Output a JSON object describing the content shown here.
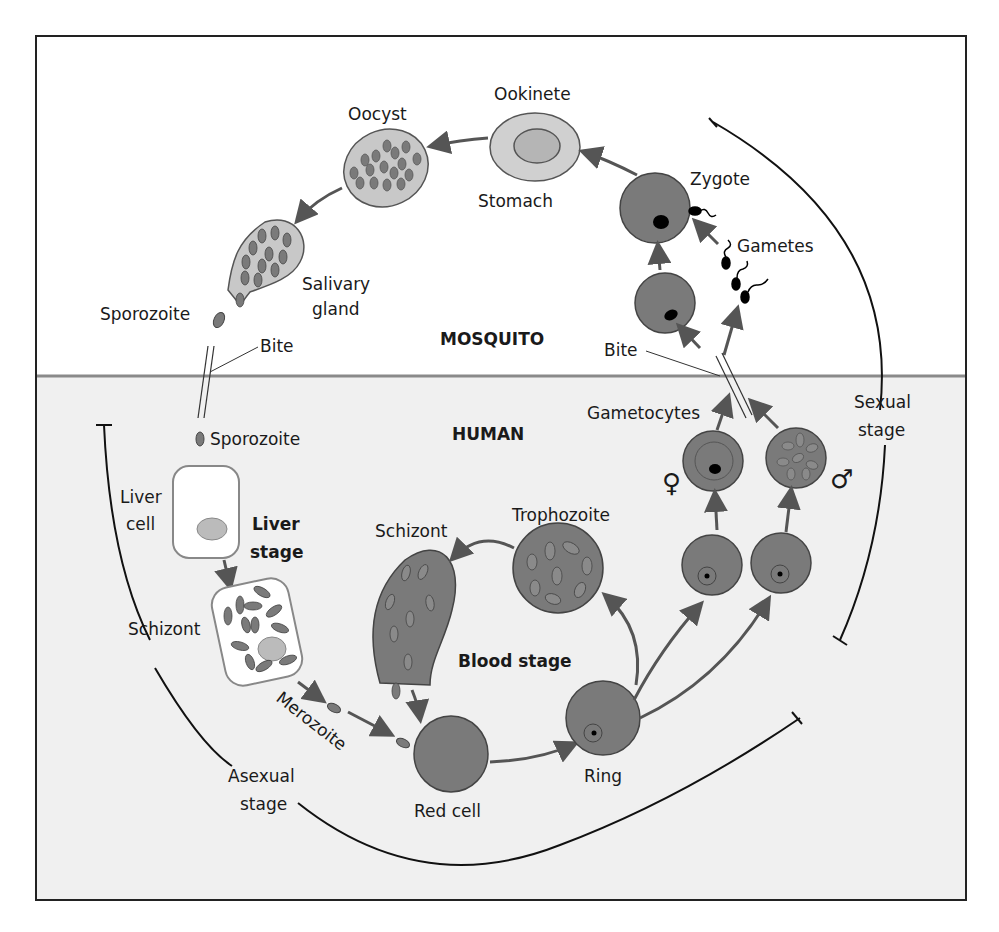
{
  "diagram": {
    "regions": {
      "mosquito": "MOSQUITO",
      "human": "HUMAN"
    },
    "labels": {
      "oocyst": "Oocyst",
      "ookinete": "Ookinete",
      "stomach": "Stomach",
      "zygote": "Zygote",
      "gametes": "Gametes",
      "salivary_gland_1": "Salivary",
      "salivary_gland_2": "gland",
      "sporozoite_top": "Sporozoite",
      "bite_left": "Bite",
      "bite_right": "Bite",
      "sporozoite_human": "Sporozoite",
      "liver_cell_1": "Liver",
      "liver_cell_2": "cell",
      "liver_stage_1": "Liver",
      "liver_stage_2": "stage",
      "schizont_liver": "Schizont",
      "schizont_blood": "Schizont",
      "trophozoite": "Trophozoite",
      "blood_stage": "Blood stage",
      "merozoite": "Merozoite",
      "red_cell": "Red cell",
      "ring": "Ring",
      "gametocytes": "Gametocytes",
      "female_symbol": "♀",
      "male_symbol": "♂",
      "sexual_stage_1": "Sexual",
      "sexual_stage_2": "stage",
      "asexual_stage_1": "Asexual",
      "asexual_stage_2": "stage"
    },
    "colors": {
      "cell_fill": "#7a7a7a",
      "light_fill": "#c8c8c8",
      "human_bg": "#f0f0f0",
      "divider": "#8a8a8a",
      "arrow": "#555555"
    }
  }
}
